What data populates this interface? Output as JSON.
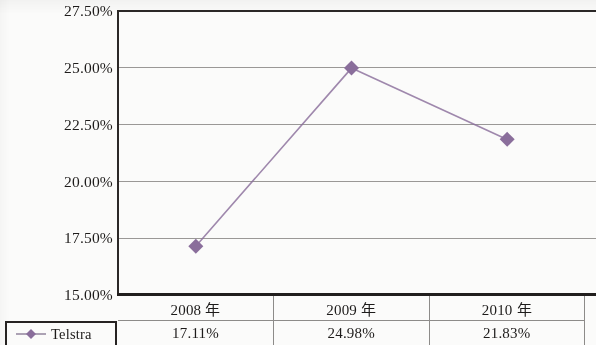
{
  "chart_data": {
    "type": "line",
    "title": "",
    "xlabel": "",
    "ylabel": "",
    "categories": [
      "2008 年",
      "2009 年",
      "2010 年"
    ],
    "series": [
      {
        "name": "Telstra",
        "values": [
          17.11,
          24.98,
          21.83
        ],
        "value_labels": [
          "17.11%",
          "24.98%",
          "21.83%"
        ],
        "color": "#8a6e9b",
        "marker": "diamond"
      }
    ],
    "ylim": [
      15.0,
      27.5
    ],
    "yticks": [
      27.5,
      25.0,
      22.5,
      20.0,
      17.5,
      15.0
    ],
    "ytick_labels": [
      "27.50%",
      "25.00%",
      "22.50%",
      "20.00%",
      "17.50%",
      "15.00%"
    ],
    "grid": true,
    "legend_position": "bottom-left"
  },
  "axis": {
    "y_labels": [
      "27.50%",
      "25.00%",
      "22.50%",
      "20.00%",
      "17.50%",
      "15.00%"
    ]
  },
  "table": {
    "header": [
      "2008 年",
      "2009 年",
      "2010 年"
    ],
    "rows": [
      {
        "label": "Telstra",
        "cells": [
          "17.11%",
          "24.98%",
          "21.83%"
        ]
      }
    ]
  },
  "legend": {
    "entries": [
      {
        "label": "Telstra",
        "color": "#8a6e9b",
        "marker": "diamond-marker"
      }
    ]
  },
  "colors": {
    "series": "#8a6e9b",
    "axis": "#211e1d",
    "gridline": "#9a9896",
    "text": "#1d1b1a",
    "background": "#fbfbfa"
  }
}
